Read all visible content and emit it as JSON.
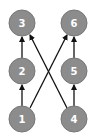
{
  "diagram": {
    "type": "directed-graph",
    "node_fill": "#8c8c8c",
    "node_stroke": "#777777",
    "edge_color": "#111111",
    "nodes": [
      {
        "id": "1",
        "label": "1",
        "x": 22,
        "y": 119
      },
      {
        "id": "2",
        "label": "2",
        "x": 22,
        "y": 71
      },
      {
        "id": "3",
        "label": "3",
        "x": 22,
        "y": 23
      },
      {
        "id": "4",
        "label": "4",
        "x": 74,
        "y": 119
      },
      {
        "id": "5",
        "label": "5",
        "x": 74,
        "y": 71
      },
      {
        "id": "6",
        "label": "6",
        "x": 74,
        "y": 23
      }
    ],
    "edges": [
      {
        "from": "1",
        "to": "2"
      },
      {
        "from": "2",
        "to": "3"
      },
      {
        "from": "4",
        "to": "5"
      },
      {
        "from": "5",
        "to": "6"
      },
      {
        "from": "1",
        "to": "6"
      },
      {
        "from": "4",
        "to": "3"
      }
    ]
  }
}
